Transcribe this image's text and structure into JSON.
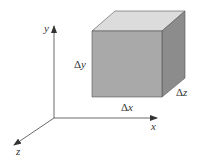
{
  "axes": {
    "x_label": "x",
    "y_label": "y",
    "z_label": "z"
  },
  "cube": {
    "dx_label": "Δx",
    "dy_label": "Δy",
    "dz_label": "Δz",
    "colors": {
      "front": "#a9a9a9",
      "top": "#dcdcdc",
      "side": "#8c8c8c",
      "edge": "#555555"
    }
  }
}
